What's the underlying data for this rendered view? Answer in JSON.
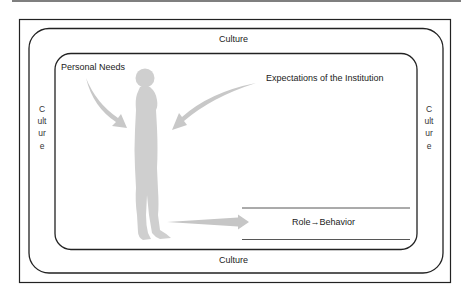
{
  "diagram": {
    "type": "nested-context-model",
    "colors": {
      "line": "#222222",
      "figure": "#cfcfcf",
      "arrow": "#c8c8c8",
      "text": "#222222",
      "background": "#ffffff"
    },
    "frames": {
      "outer_box": "square frame",
      "culture_ring": "rounded rectangle labeled Culture on all four sides",
      "inner_context": "rounded rectangle containing person and role"
    },
    "labels": {
      "culture_top": "Culture",
      "culture_bottom": "Culture",
      "culture_left": "Culture",
      "culture_right": "Culture",
      "personal_needs": "Personal Needs",
      "expectations": "Expectations of the Institution",
      "role_behavior": "Role→Behavior"
    },
    "elements": {
      "person": "grey standing human silhouette (side view)",
      "arrow_personal_needs": "curved arrow from Personal Needs toward person",
      "arrow_expectations": "curved arrow from Expectations of the Institution toward person",
      "arrow_to_role": "horizontal tapered arrow from person to Role→Behavior band"
    }
  }
}
